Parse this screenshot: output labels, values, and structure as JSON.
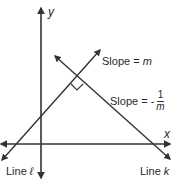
{
  "diagram": {
    "axes": {
      "x_label": "x",
      "y_label": "y"
    },
    "lines": [
      {
        "name": "Line ℓ",
        "label": "Line ",
        "var": "ℓ",
        "slope_label": "Slope = ",
        "slope_value": "m"
      },
      {
        "name": "Line k",
        "label": "Line ",
        "var": "k",
        "slope_label": "Slope = -",
        "slope_num": "1",
        "slope_den": "m"
      }
    ],
    "annotations": {
      "right_angle": "perpendicular marker at intersection"
    },
    "colors": {
      "stroke": "#333333",
      "background": "#ffffff"
    }
  }
}
